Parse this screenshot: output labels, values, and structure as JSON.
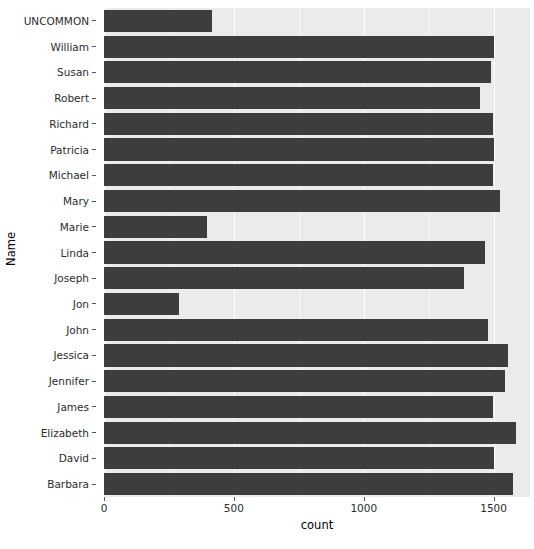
{
  "chart_data": {
    "type": "bar",
    "orientation": "horizontal",
    "title": "",
    "xlabel": "count",
    "ylabel": "Name",
    "xlim": [
      0,
      1640
    ],
    "xticks": [
      0,
      500,
      1000,
      1500
    ],
    "xtick_labels": [
      "0",
      "500",
      "1000",
      "1500"
    ],
    "x_minor_ticks": [
      250,
      750,
      1250
    ],
    "grid": true,
    "grid_major_color": "#ffffff",
    "grid_minor_color": "#f7f7f7",
    "panel_background": "#ebebeb",
    "bar_color": "#3d3d3d",
    "legend": null,
    "categories": [
      "UNCOMMON",
      "William",
      "Susan",
      "Robert",
      "Richard",
      "Patricia",
      "Michael",
      "Mary",
      "Marie",
      "Linda",
      "Joseph",
      "Jon",
      "John",
      "Jessica",
      "Jennifer",
      "James",
      "Elizabeth",
      "David",
      "Barbara"
    ],
    "values": [
      416,
      1501,
      1489,
      1448,
      1497,
      1501,
      1497,
      1526,
      395,
      1468,
      1386,
      289,
      1480,
      1554,
      1542,
      1497,
      1588,
      1500,
      1575
    ]
  }
}
